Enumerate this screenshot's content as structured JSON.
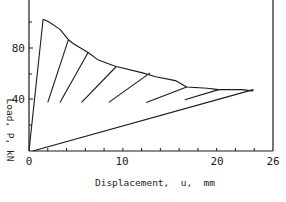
{
  "chart_data": {
    "type": "line",
    "title": "",
    "xlabel": "Displacement, u, mm",
    "ylabel": "Load, P, kN",
    "xlim": [
      0,
      26
    ],
    "ylim": [
      0,
      118
    ],
    "x_ticks": [
      0,
      10,
      20,
      26
    ],
    "x_tick_labels": [
      "0",
      "10",
      "20",
      "26"
    ],
    "x_minor_tick_step": 2,
    "y_ticks": [
      0,
      40,
      80
    ],
    "y_tick_labels": [
      "0",
      "40",
      "80"
    ],
    "grid": false,
    "legend": null,
    "series": [
      {
        "name": "initial-loading",
        "x": [
          0,
          1.5
        ],
        "y": [
          0,
          103
        ]
      },
      {
        "name": "envelope",
        "x": [
          1.5,
          2.1,
          3.3,
          4.2,
          4.7,
          6.3,
          7.4,
          8.9,
          9.3,
          12.1,
          13.5,
          15.6,
          16.8,
          19.0,
          20.2,
          22.7,
          23.8,
          23.9
        ],
        "y": [
          103,
          101,
          95,
          87,
          84,
          77,
          71,
          67,
          66,
          61,
          58,
          55,
          50,
          49,
          48,
          48,
          47,
          48
        ]
      },
      {
        "name": "unloading-1",
        "x": [
          4.2,
          2.0
        ],
        "y": [
          87,
          38
        ]
      },
      {
        "name": "unloading-2",
        "x": [
          6.3,
          3.3
        ],
        "y": [
          77,
          38
        ]
      },
      {
        "name": "unloading-3",
        "x": [
          9.3,
          5.6
        ],
        "y": [
          66,
          38
        ]
      },
      {
        "name": "unloading-4",
        "x": [
          12.9,
          8.5
        ],
        "y": [
          61,
          38
        ]
      },
      {
        "name": "unloading-5",
        "x": [
          16.8,
          12.5
        ],
        "y": [
          50,
          38
        ]
      },
      {
        "name": "unloading-6",
        "x": [
          20.2,
          16.6
        ],
        "y": [
          48,
          40
        ]
      },
      {
        "name": "reloading",
        "x": [
          0.4,
          23.9
        ],
        "y": [
          0,
          48
        ]
      }
    ]
  },
  "labels": {
    "x_axis_title": "Displacement,  u,  mm",
    "y_axis_title": "Load, P, kN",
    "x_tick_0": "0",
    "x_tick_10": "10",
    "x_tick_20": "20",
    "x_tick_26": "26",
    "y_tick_0": "0",
    "y_tick_40": "40",
    "y_tick_80": "80"
  },
  "colors": {
    "line": "#1a1a1a",
    "background": "#ffffff"
  }
}
